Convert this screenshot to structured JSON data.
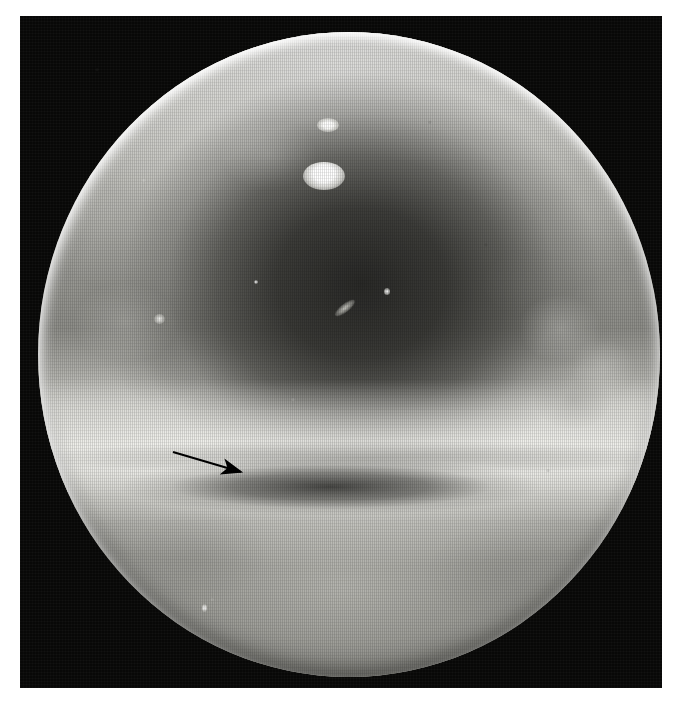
{
  "figure": {
    "kind": "endoscopic-photograph",
    "modality_label": "endoscopy",
    "caption_text": "",
    "canvas": {
      "width": 680,
      "height": 705
    },
    "background_color": "#ffffff"
  },
  "photo_frame": {
    "name": "black-photographic-border",
    "x": 20,
    "y": 16,
    "width": 642,
    "height": 672,
    "color": "#080807"
  },
  "field_of_view": {
    "name": "circular-endoscope-field",
    "center_x": 349,
    "center_y": 354,
    "radius_x": 311,
    "radius_y": 322,
    "base_color": "#8e8e8a",
    "rim_color": "#fcfcfa"
  },
  "anatomy_regions": [
    {
      "name": "bright-superior-mucosa",
      "label": "bright upper mucosal wall",
      "tone": "#e6e6e1"
    },
    {
      "name": "central-lumen",
      "label": "dark central lumen",
      "tone": "#2c2c2a"
    },
    {
      "name": "mid-bright-band",
      "label": "bright transverse mucosal fold",
      "tone": "#f4f4f0"
    },
    {
      "name": "shadow-groove",
      "label": "dark transverse groove",
      "tone": "#262624"
    },
    {
      "name": "inferior-mucosa",
      "label": "lower mucosal surface",
      "tone": "#8f8f8a"
    }
  ],
  "specular_highlights": [
    {
      "name": "specular-upper",
      "x": 330,
      "y": 425,
      "w": 22,
      "h": 14,
      "color": "#ffffff"
    },
    {
      "name": "specular-lower",
      "x": 322,
      "y": 476,
      "w": 42,
      "h": 28,
      "color": "#ffffff"
    },
    {
      "name": "specular-streak",
      "x": 333,
      "y": 308,
      "w": 24,
      "h": 8,
      "color": "#d7d7d0"
    },
    {
      "name": "specular-dot",
      "x": 385,
      "y": 294,
      "w": 6,
      "h": 7,
      "color": "#ffffff"
    },
    {
      "name": "specular-flake-left",
      "x": 157,
      "y": 325,
      "w": 11,
      "h": 10,
      "color": "#f8f8f4"
    },
    {
      "name": "specular-flake-low",
      "x": 203,
      "y": 608,
      "w": 5,
      "h": 8,
      "color": "#ffffff"
    },
    {
      "name": "specular-pin-mid",
      "x": 256,
      "y": 290,
      "w": 4,
      "h": 4,
      "color": "#ffffff"
    }
  ],
  "annotation": {
    "name": "pointer-arrow",
    "type": "arrow",
    "color": "#000000",
    "tail_x": 173,
    "tail_y": 452,
    "tip_x": 248,
    "tip_y": 474,
    "line_width": 2.2,
    "head_length": 17,
    "head_width": 13,
    "points_at": "shadow-groove"
  }
}
